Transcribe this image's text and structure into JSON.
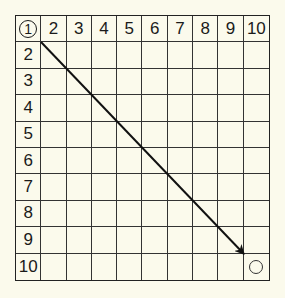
{
  "grid": {
    "rows": 10,
    "cols": 10,
    "start_label": "1",
    "column_headers": [
      "1",
      "2",
      "3",
      "4",
      "5",
      "6",
      "7",
      "8",
      "9",
      "10"
    ],
    "row_headers": [
      "1",
      "2",
      "3",
      "4",
      "5",
      "6",
      "7",
      "8",
      "9",
      "10"
    ],
    "goal_cell": {
      "row": 10,
      "col": 10,
      "marker": "circle"
    }
  },
  "arrow": {
    "from": "cell(1,1) corner",
    "to": "cell(9,9) bottom-right corner",
    "direction": "diagonal"
  },
  "colors": {
    "background": "#fbfaec",
    "lines": "#222222",
    "text": "#1a1a1a"
  }
}
